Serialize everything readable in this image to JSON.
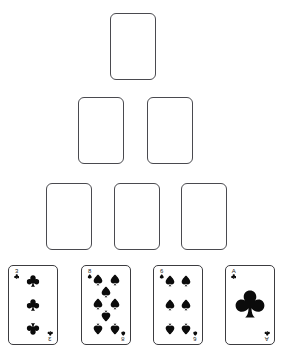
{
  "board": {
    "name": "pyramid-card-tableau",
    "background_color": "#ffffff",
    "slot_border_color": "#4a4a4f",
    "card_border_color": "#3c3c40",
    "pip_color": "#0b0b0b",
    "rows": [
      {
        "row_index": 1,
        "slot_count": 1
      },
      {
        "row_index": 2,
        "slot_count": 2
      },
      {
        "row_index": 3,
        "slot_count": 3
      },
      {
        "row_index": 4,
        "card_count": 4
      }
    ],
    "empty_slots": [
      {
        "id": "slot-r1-c1",
        "row": 1,
        "col": 1,
        "x": 110,
        "y": 13,
        "w": 46,
        "h": 67,
        "state": "empty"
      },
      {
        "id": "slot-r2-c1",
        "row": 2,
        "col": 1,
        "x": 78,
        "y": 97,
        "w": 46,
        "h": 67,
        "state": "empty"
      },
      {
        "id": "slot-r2-c2",
        "row": 2,
        "col": 2,
        "x": 147,
        "y": 97,
        "w": 46,
        "h": 67,
        "state": "empty"
      },
      {
        "id": "slot-r3-c1",
        "row": 3,
        "col": 1,
        "x": 46,
        "y": 183,
        "w": 46,
        "h": 67,
        "state": "empty"
      },
      {
        "id": "slot-r3-c2",
        "row": 3,
        "col": 2,
        "x": 114,
        "y": 183,
        "w": 46,
        "h": 67,
        "state": "empty"
      },
      {
        "id": "slot-r3-c3",
        "row": 3,
        "col": 3,
        "x": 181,
        "y": 183,
        "w": 46,
        "h": 67,
        "state": "empty"
      }
    ],
    "cards": [
      {
        "id": "card-3-of-clubs",
        "rank": "3",
        "suit": "clubs",
        "suit_symbol": "♣",
        "label": "3 of Clubs",
        "color": "black",
        "x": 8,
        "y": 265,
        "w": 50,
        "h": 80,
        "pip_layout": [
          {
            "cx": 50,
            "cy": 14,
            "rot": 0
          },
          {
            "cx": 50,
            "cy": 50,
            "rot": 0
          },
          {
            "cx": 50,
            "cy": 86,
            "rot": 180
          }
        ],
        "pip_size": 13
      },
      {
        "id": "card-8-of-spades",
        "rank": "8",
        "suit": "spades",
        "suit_symbol": "♠",
        "label": "8 of Spades",
        "color": "black",
        "x": 81,
        "y": 265,
        "w": 50,
        "h": 80,
        "pip_layout": [
          {
            "cx": 25,
            "cy": 12,
            "rot": 0
          },
          {
            "cx": 75,
            "cy": 12,
            "rot": 0
          },
          {
            "cx": 50,
            "cy": 30,
            "rot": 0
          },
          {
            "cx": 25,
            "cy": 48,
            "rot": 0
          },
          {
            "cx": 75,
            "cy": 48,
            "rot": 0
          },
          {
            "cx": 50,
            "cy": 66,
            "rot": 180
          },
          {
            "cx": 25,
            "cy": 86,
            "rot": 180
          },
          {
            "cx": 75,
            "cy": 86,
            "rot": 180
          }
        ],
        "pip_size": 12
      },
      {
        "id": "card-6-of-spades",
        "rank": "6",
        "suit": "spades",
        "suit_symbol": "♠",
        "label": "6 of Spades",
        "color": "black",
        "x": 153,
        "y": 265,
        "w": 50,
        "h": 80,
        "pip_layout": [
          {
            "cx": 27,
            "cy": 13,
            "rot": 0
          },
          {
            "cx": 73,
            "cy": 13,
            "rot": 0
          },
          {
            "cx": 27,
            "cy": 50,
            "rot": 0
          },
          {
            "cx": 73,
            "cy": 50,
            "rot": 0
          },
          {
            "cx": 27,
            "cy": 87,
            "rot": 180
          },
          {
            "cx": 73,
            "cy": 87,
            "rot": 180
          }
        ],
        "pip_size": 12
      },
      {
        "id": "card-ace-of-clubs",
        "rank": "A",
        "suit": "clubs",
        "suit_symbol": "♣",
        "label": "Ace of Clubs",
        "color": "black",
        "x": 225,
        "y": 265,
        "w": 50,
        "h": 80,
        "pip_layout": [
          {
            "cx": 50,
            "cy": 48,
            "rot": 0
          }
        ],
        "pip_size": 30
      }
    ]
  }
}
